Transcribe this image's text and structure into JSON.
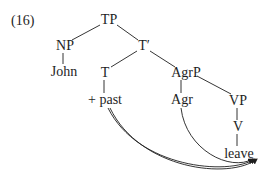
{
  "example_number": "(16)",
  "tree": {
    "nodes": {
      "tp": "TP",
      "np": "NP",
      "t_bar": "T′",
      "john": "John",
      "t": "T",
      "agrp": "AgrP",
      "past": "+ past",
      "agr": "Agr",
      "vp": "VP",
      "v": "V",
      "leave": "leave"
    },
    "edges": [
      [
        "TP",
        "NP"
      ],
      [
        "TP",
        "T′"
      ],
      [
        "NP",
        "John"
      ],
      [
        "T′",
        "T"
      ],
      [
        "T′",
        "AgrP"
      ],
      [
        "T",
        "+ past"
      ],
      [
        "AgrP",
        "Agr"
      ],
      [
        "AgrP",
        "VP"
      ],
      [
        "VP",
        "V"
      ],
      [
        "V",
        "leave"
      ]
    ],
    "movement_arrows": [
      {
        "from": "+ past",
        "to": "leave"
      },
      {
        "from": "Agr",
        "to": "leave"
      }
    ]
  },
  "colors": {
    "ink": "#1e1e1e"
  }
}
